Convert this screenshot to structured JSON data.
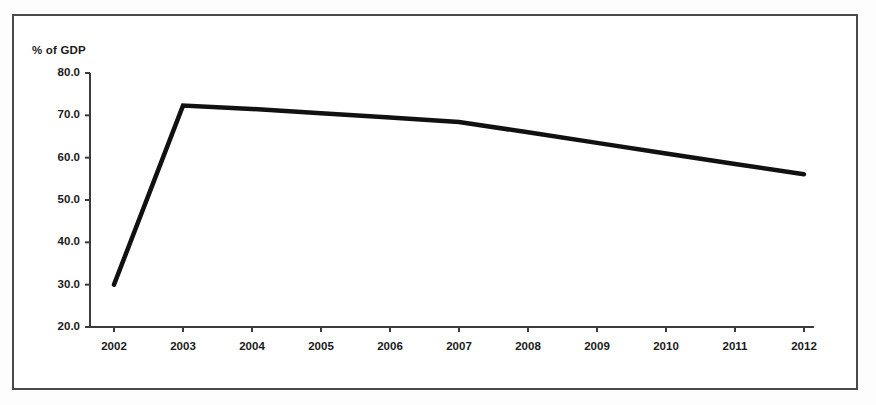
{
  "figure": {
    "frame_color": "#4a4a4a",
    "background_color": "#ffffff"
  },
  "chart_data": {
    "type": "line",
    "title": "",
    "subtitle": "",
    "xlabel": "",
    "ylabel": "% of GDP",
    "categories": [
      "2002",
      "2003",
      "2004",
      "2005",
      "2006",
      "2007",
      "2008",
      "2009",
      "2010",
      "2011",
      "2012"
    ],
    "x": [
      2002,
      2003,
      2004,
      2005,
      2006,
      2007,
      2008,
      2009,
      2010,
      2011,
      2012
    ],
    "values": [
      30.0,
      72.3,
      71.5,
      70.5,
      69.5,
      68.4,
      66.0,
      63.5,
      61.0,
      58.5,
      56.1
    ],
    "series": [
      {
        "name": "% of GDP",
        "values": [
          30.0,
          72.3,
          71.5,
          70.5,
          69.5,
          68.4,
          66.0,
          63.5,
          61.0,
          58.5,
          56.1
        ],
        "color": "#111111",
        "line_width": 4.5,
        "markers": "none"
      }
    ],
    "ylim": [
      20.0,
      80.0
    ],
    "ytick_values": [
      20.0,
      30.0,
      40.0,
      50.0,
      60.0,
      70.0,
      80.0
    ],
    "ytick_labels": [
      "20.0",
      "30.0",
      "40.0",
      "50.0",
      "60.0",
      "70.0",
      "80.0"
    ],
    "xtick_labels": [
      "2002",
      "2003",
      "2004",
      "2005",
      "2006",
      "2007",
      "2008",
      "2009",
      "2010",
      "2011",
      "2012"
    ],
    "grid": false,
    "legend": false,
    "legend_position": "none",
    "annotations": []
  }
}
